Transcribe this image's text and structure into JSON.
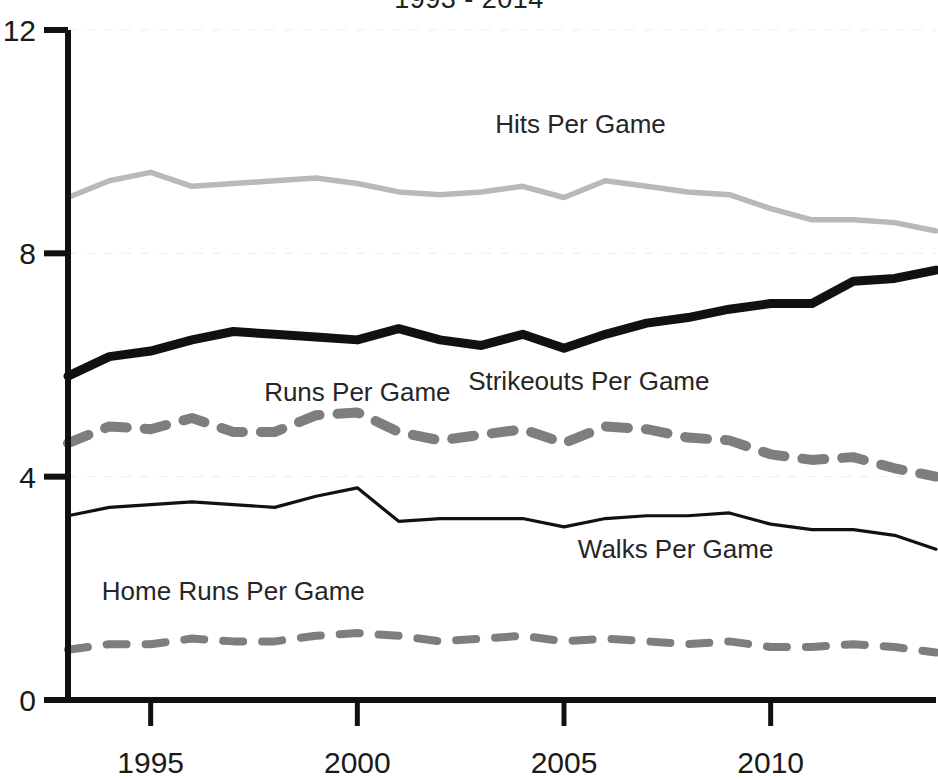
{
  "chart_data": {
    "type": "line",
    "title": "1993 - 2014",
    "xlabel": "",
    "ylabel": "",
    "xlim": [
      1993,
      2014
    ],
    "ylim": [
      0,
      12
    ],
    "yticks": [
      0,
      4,
      8,
      12
    ],
    "xticks": [
      1995,
      2000,
      2005,
      2010
    ],
    "ytick_labels": [
      "0",
      "4",
      "8",
      "12"
    ],
    "xtick_labels": [
      "1995",
      "2000",
      "2005",
      "2010"
    ],
    "grid": true,
    "legend_position": "inline-annotations",
    "x": [
      1993,
      1994,
      1995,
      1996,
      1997,
      1998,
      1999,
      2000,
      2001,
      2002,
      2003,
      2004,
      2005,
      2006,
      2007,
      2008,
      2009,
      2010,
      2011,
      2012,
      2013,
      2014
    ],
    "series": [
      {
        "name": "Hits Per Game",
        "color": "#b9b9b9",
        "style": "solid-thin",
        "label_x": 2005.4,
        "label_y": 10.15,
        "values": [
          9.0,
          9.3,
          9.45,
          9.2,
          9.25,
          9.3,
          9.35,
          9.25,
          9.1,
          9.05,
          9.1,
          9.2,
          9.0,
          9.3,
          9.2,
          9.1,
          9.05,
          8.8,
          8.6,
          8.6,
          8.55,
          8.4
        ]
      },
      {
        "name": "Strikeouts Per Game",
        "color": "#111111",
        "style": "solid-thick",
        "label_x": 2005.6,
        "label_y": 5.55,
        "values": [
          5.8,
          6.15,
          6.25,
          6.45,
          6.6,
          6.55,
          6.5,
          6.45,
          6.65,
          6.45,
          6.35,
          6.55,
          6.3,
          6.55,
          6.75,
          6.85,
          7.0,
          7.1,
          7.1,
          7.5,
          7.55,
          7.7
        ]
      },
      {
        "name": "Runs Per Game",
        "color": "#7e7e7e",
        "style": "dashed-thick",
        "label_x": 2000.0,
        "label_y": 5.35,
        "values": [
          4.6,
          4.9,
          4.85,
          5.05,
          4.8,
          4.8,
          5.1,
          5.15,
          4.8,
          4.65,
          4.75,
          4.85,
          4.6,
          4.9,
          4.85,
          4.7,
          4.65,
          4.4,
          4.3,
          4.35,
          4.15,
          4.0
        ]
      },
      {
        "name": "Walks Per Game",
        "color": "#111111",
        "style": "solid-thin",
        "label_x": 2007.7,
        "label_y": 2.55,
        "values": [
          3.3,
          3.45,
          3.5,
          3.55,
          3.5,
          3.45,
          3.65,
          3.8,
          3.2,
          3.25,
          3.25,
          3.25,
          3.1,
          3.25,
          3.3,
          3.3,
          3.35,
          3.15,
          3.05,
          3.05,
          2.95,
          2.7
        ]
      },
      {
        "name": "Home Runs Per Game",
        "color": "#7e7e7e",
        "style": "dashed-thin",
        "label_x": 1997.0,
        "label_y": 1.8,
        "values": [
          0.9,
          1.0,
          1.0,
          1.1,
          1.05,
          1.05,
          1.15,
          1.2,
          1.15,
          1.05,
          1.1,
          1.15,
          1.05,
          1.1,
          1.05,
          1.0,
          1.05,
          0.95,
          0.95,
          1.0,
          0.95,
          0.85
        ]
      }
    ]
  }
}
